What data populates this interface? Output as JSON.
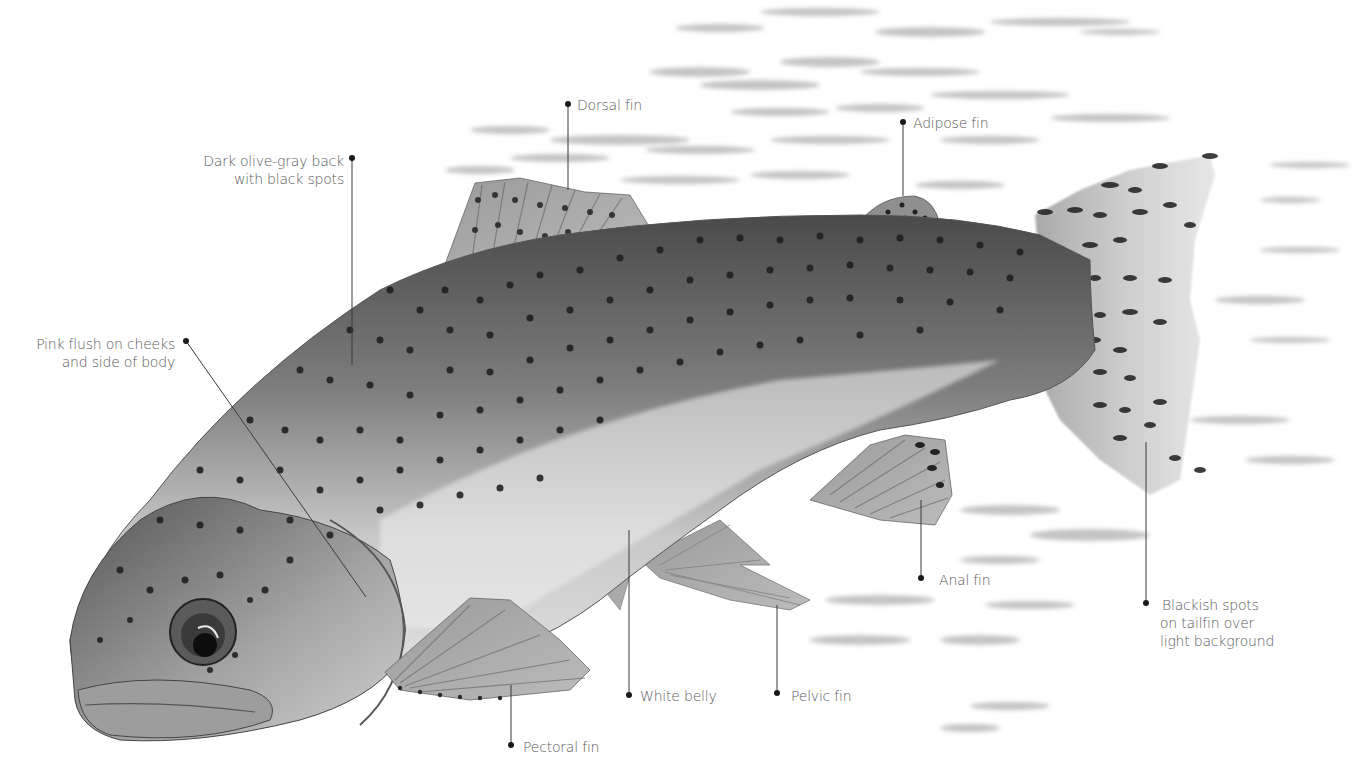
{
  "figure": {
    "title_cropped": "",
    "colors": {
      "background": "#ffffff",
      "label_text": "#5a5a5a",
      "leader_line": "#3a3a3a",
      "fish_dark": "#3c3c3c",
      "fish_mid": "#8a8a8a",
      "fish_light": "#d9d9d9",
      "spots": "#1e1e1e",
      "water": "#b5b5b5"
    }
  },
  "labels": {
    "dorsal_fin": "Dorsal fin",
    "adipose_fin": "Adipose fin",
    "back_line1": "Dark olive-gray back",
    "back_line2": "with black spots",
    "pink_line1": "Pink flush on cheeks",
    "pink_line2": "and side of body",
    "tail_line1": "Blackish spots",
    "tail_line2": "on tailfin over",
    "tail_line3": "light background",
    "anal_fin": "Anal fin",
    "white_belly": "White belly",
    "pelvic_fin": "Pelvic fin",
    "pectoral_fin": "Pectoral fin"
  }
}
